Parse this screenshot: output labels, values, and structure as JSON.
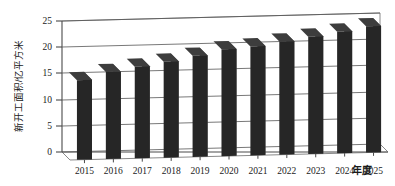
{
  "chart_data": {
    "type": "bar",
    "title": "",
    "subtitle": "",
    "xlabel": "年度",
    "ylabel": "新开工面积/亿平方米",
    "categories": [
      "2015",
      "2016",
      "2017",
      "2018",
      "2019",
      "2020",
      "2021",
      "2022",
      "2023",
      "2024",
      "2025"
    ],
    "values": [
      15.2,
      16.6,
      17.5,
      18.3,
      19.3,
      20.4,
      20.8,
      21.6,
      22.4,
      23.2,
      24.1
    ],
    "series": [
      {
        "name": "新开工面积",
        "values": [
          15.2,
          16.6,
          17.5,
          18.3,
          19.3,
          20.4,
          20.8,
          21.6,
          22.4,
          23.2,
          24.1
        ]
      }
    ],
    "ylim": [
      0,
      25
    ],
    "yticks": [
      0,
      5,
      10,
      15,
      20,
      25
    ],
    "ytick_labels": [
      "0",
      "5",
      "10",
      "15",
      "20",
      "25"
    ],
    "grid": true,
    "grid_axis": "y",
    "legend": false,
    "legend_position": "none",
    "style": "3d-column",
    "bar_color": "#262626",
    "bar_top_color": "#3d3d3d",
    "bar_side_color": "#565656",
    "gridline_color": "#555555",
    "background_color": "#ffffff",
    "annotations": []
  },
  "axes": {
    "y_title": "新开工面积/亿平方米",
    "x_title": "年度"
  }
}
